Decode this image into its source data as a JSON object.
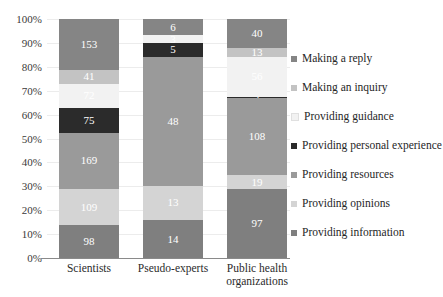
{
  "chart_data": {
    "type": "bar",
    "subtype": "stacked-percentage",
    "title": "",
    "xlabel": "",
    "ylabel": "",
    "ylim": [
      0,
      100
    ],
    "grid": true,
    "legend_position": "right",
    "categories": [
      "Scientists",
      "Pseudo-experts",
      "Public health organizations"
    ],
    "y_ticks": [
      "0%",
      "10%",
      "20%",
      "30%",
      "40%",
      "50%",
      "60%",
      "70%",
      "80%",
      "90%",
      "100%"
    ],
    "series": [
      {
        "name": "Providing information",
        "color": "#7f7f7f",
        "label_color": "#ffffff",
        "values": [
          98,
          14,
          97
        ]
      },
      {
        "name": "Providing opinions",
        "color": "#d4d4d4",
        "label_color": "#ffffff",
        "values": [
          109,
          13,
          19
        ]
      },
      {
        "name": "Providing resources",
        "color": "#9a9a9a",
        "label_color": "#ffffff",
        "values": [
          169,
          48,
          108
        ]
      },
      {
        "name": "Providing personal experience",
        "color": "#2b2b2b",
        "label_color": "#ffffff",
        "values": [
          75,
          5,
          2
        ]
      },
      {
        "name": "Providing guidance",
        "color": "#f2f2f2",
        "label_color": "#ffffff",
        "values": [
          72,
          3,
          56
        ]
      },
      {
        "name": "Making an inquiry",
        "color": "#c3c3c3",
        "label_color": "#ffffff",
        "values": [
          41,
          0,
          13
        ]
      },
      {
        "name": "Making a reply",
        "color": "#858585",
        "label_color": "#ffffff",
        "values": [
          153,
          6,
          40
        ]
      }
    ],
    "totals": [
      717,
      89,
      335
    ]
  },
  "legend": {
    "items": [
      {
        "label": "Making a reply",
        "color": "#858585"
      },
      {
        "label": "Making an inquiry",
        "color": "#c3c3c3"
      },
      {
        "label": "Providing guidance",
        "color": "#f2f2f2"
      },
      {
        "label": "Providing personal experience",
        "color": "#2b2b2b"
      },
      {
        "label": "Providing resources",
        "color": "#9a9a9a"
      },
      {
        "label": "Providing opinions",
        "color": "#d4d4d4"
      },
      {
        "label": "Providing information",
        "color": "#7f7f7f"
      }
    ]
  }
}
